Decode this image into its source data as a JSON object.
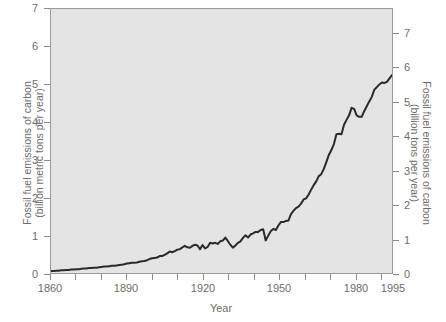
{
  "chart_data": {
    "type": "line",
    "title": "",
    "xlabel": "Year",
    "ylabel": "Fossil fuel emissions of carbon (billion metric tons per year)",
    "ylabel_right": "Fossil fuel emissions of carbon (billion tons per year)",
    "xlim": [
      1860,
      1995
    ],
    "ylim": [
      0,
      7
    ],
    "ylim_right": [
      0,
      7.7
    ],
    "grid": false,
    "legend": false,
    "axis_left": {
      "label_line1": "Fossil fuel emissions of carbon",
      "label_line2": "(billion metric tons per year)",
      "ticks": [
        0,
        1,
        2,
        3,
        4,
        5,
        6,
        7
      ],
      "tick_labels": [
        "0",
        "1",
        "2",
        "3",
        "4",
        "5",
        "6",
        "7"
      ],
      "units": "billion metric tons per year"
    },
    "axis_right": {
      "label_line1": "Fossil fuel emissions of carbon",
      "label_line2": "(billion tons per year)",
      "ticks": [
        0,
        1,
        2,
        3,
        4,
        5,
        6,
        7
      ],
      "tick_labels": [
        "0",
        "1",
        "2",
        "3",
        "4",
        "5",
        "6",
        "7"
      ],
      "units": "billion tons per year"
    },
    "axis_bottom": {
      "label": "Year",
      "major_ticks": [
        1860,
        1890,
        1920,
        1950,
        1980,
        1995
      ],
      "major_tick_labels": [
        "1860",
        "1890",
        "1920",
        "1950",
        "1980",
        "1995"
      ],
      "minor_ticks": [
        1870,
        1880,
        1900,
        1910,
        1930,
        1940,
        1960,
        1970,
        1990
      ]
    },
    "series": [
      {
        "name": "Fossil fuel emissions of carbon",
        "color": "#2a2a2a",
        "line_width": 2,
        "x": [
          1860,
          1861,
          1862,
          1863,
          1864,
          1865,
          1866,
          1867,
          1868,
          1869,
          1870,
          1871,
          1872,
          1873,
          1874,
          1875,
          1876,
          1877,
          1878,
          1879,
          1880,
          1881,
          1882,
          1883,
          1884,
          1885,
          1886,
          1887,
          1888,
          1889,
          1890,
          1891,
          1892,
          1893,
          1894,
          1895,
          1896,
          1897,
          1898,
          1899,
          1900,
          1901,
          1902,
          1903,
          1904,
          1905,
          1906,
          1907,
          1908,
          1909,
          1910,
          1911,
          1912,
          1913,
          1914,
          1915,
          1916,
          1917,
          1918,
          1919,
          1920,
          1921,
          1922,
          1923,
          1924,
          1925,
          1926,
          1927,
          1928,
          1929,
          1930,
          1931,
          1932,
          1933,
          1934,
          1935,
          1936,
          1937,
          1938,
          1939,
          1940,
          1941,
          1942,
          1943,
          1944,
          1945,
          1946,
          1947,
          1948,
          1949,
          1950,
          1951,
          1952,
          1953,
          1954,
          1955,
          1956,
          1957,
          1958,
          1959,
          1960,
          1961,
          1962,
          1963,
          1964,
          1965,
          1966,
          1967,
          1968,
          1969,
          1970,
          1971,
          1972,
          1973,
          1974,
          1975,
          1976,
          1977,
          1978,
          1979,
          1980,
          1981,
          1982,
          1983,
          1984,
          1985,
          1986,
          1987,
          1988,
          1989,
          1990,
          1991,
          1992,
          1993,
          1994,
          1995
        ],
        "y": [
          0.05,
          0.05,
          0.06,
          0.06,
          0.07,
          0.07,
          0.08,
          0.08,
          0.09,
          0.09,
          0.1,
          0.1,
          0.11,
          0.12,
          0.12,
          0.13,
          0.13,
          0.14,
          0.14,
          0.15,
          0.16,
          0.17,
          0.17,
          0.18,
          0.19,
          0.19,
          0.2,
          0.21,
          0.22,
          0.23,
          0.25,
          0.26,
          0.27,
          0.27,
          0.28,
          0.3,
          0.31,
          0.32,
          0.34,
          0.37,
          0.39,
          0.4,
          0.41,
          0.45,
          0.45,
          0.48,
          0.52,
          0.57,
          0.55,
          0.58,
          0.62,
          0.63,
          0.68,
          0.72,
          0.68,
          0.67,
          0.72,
          0.75,
          0.73,
          0.63,
          0.74,
          0.65,
          0.69,
          0.8,
          0.78,
          0.8,
          0.77,
          0.84,
          0.86,
          0.94,
          0.85,
          0.75,
          0.67,
          0.73,
          0.8,
          0.84,
          0.93,
          1.0,
          0.94,
          1.02,
          1.05,
          1.09,
          1.09,
          1.14,
          1.16,
          0.86,
          0.99,
          1.11,
          1.17,
          1.14,
          1.26,
          1.35,
          1.35,
          1.38,
          1.39,
          1.56,
          1.65,
          1.72,
          1.76,
          1.84,
          1.95,
          1.98,
          2.08,
          2.21,
          2.33,
          2.43,
          2.57,
          2.62,
          2.76,
          2.94,
          3.13,
          3.26,
          3.42,
          3.68,
          3.69,
          3.68,
          3.93,
          4.06,
          4.18,
          4.38,
          4.35,
          4.18,
          4.14,
          4.14,
          4.29,
          4.42,
          4.55,
          4.67,
          4.86,
          4.93,
          5.0,
          5.05,
          5.04,
          5.07,
          5.16,
          5.25
        ]
      }
    ],
    "annotations": []
  },
  "colors": {
    "plot_background": "#e4e4e4",
    "page_background": "#ffffff",
    "axis": "#9a9a9a",
    "tick": "#8c8c8c",
    "text": "#6d6d6d",
    "line": "#2a2a2a"
  }
}
